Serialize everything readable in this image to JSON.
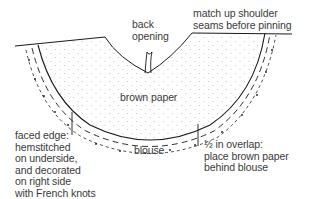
{
  "diagram": {
    "labels": {
      "back_opening": [
        "back",
        "opening"
      ],
      "shoulder": [
        "match up shoulder",
        "seams before pinning"
      ],
      "brown_paper": "brown paper",
      "blouse": "blouse",
      "faced_edge": [
        "faced edge:",
        "hemstitched",
        "on underside,",
        "and decorated",
        "on right side",
        "with French knots"
      ],
      "overlap": [
        "½ in overlap:",
        "place brown paper",
        "behind blouse"
      ]
    },
    "colors": {
      "line": "#1a1a1a",
      "text": "#3a3a3a",
      "stipple": "#b5b5b5",
      "background": "#ffffff"
    }
  }
}
